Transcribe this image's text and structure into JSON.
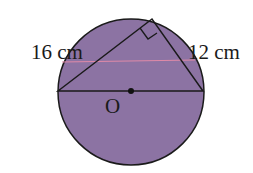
{
  "diagram": {
    "labels": {
      "left_side": "16 cm",
      "right_side": "12 cm",
      "center": "O"
    },
    "colors": {
      "circle_fill": "#8c73a3",
      "stroke": "#1a1a1a",
      "stray_line": "#e08aa8"
    }
  }
}
